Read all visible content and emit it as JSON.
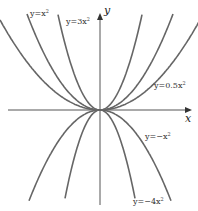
{
  "chart_data": {
    "type": "line",
    "title": "",
    "xlabel": "x",
    "ylabel": "y",
    "grid": false,
    "series": [
      {
        "name": "y=x^2",
        "a": 1,
        "label_text": "y=x",
        "label_sup": "2"
      },
      {
        "name": "y=3x^2",
        "a": 3,
        "label_text": "y=3x",
        "label_sup": "2"
      },
      {
        "name": "y=0.5x^2",
        "a": 0.5,
        "label_text": "y=0.5x",
        "label_sup": "2"
      },
      {
        "name": "y=-x^2",
        "a": -1,
        "label_text": "y=−x",
        "label_sup": "2"
      },
      {
        "name": "y=-4x^2",
        "a": -4,
        "label_text": "y=−4x",
        "label_sup": "2"
      }
    ],
    "curve_color": "#666666",
    "axis_color": "#555555"
  },
  "axes": {
    "x_label": "x",
    "y_label": "y"
  }
}
